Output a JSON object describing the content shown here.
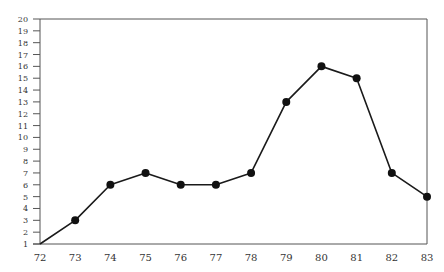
{
  "chart_data": {
    "type": "line",
    "title": "",
    "xlabel": "",
    "ylabel": "",
    "x": [
      "72",
      "73",
      "74",
      "75",
      "76",
      "77",
      "78",
      "79",
      "80",
      "81",
      "82",
      "83"
    ],
    "series": [
      {
        "name": "series",
        "values": [
          1,
          3,
          6,
          7,
          6,
          6,
          7,
          13,
          16,
          15,
          7,
          5
        ]
      }
    ],
    "yticks": [
      1,
      2,
      3,
      4,
      5,
      6,
      7,
      8,
      9,
      10,
      11,
      12,
      13,
      14,
      15,
      16,
      17,
      18,
      19,
      20
    ],
    "ylim": [
      1,
      20
    ],
    "grid": false,
    "legend": "none",
    "colors": {
      "line": "#1a1a1a",
      "marker": "#111111",
      "axis": "#555555"
    }
  }
}
